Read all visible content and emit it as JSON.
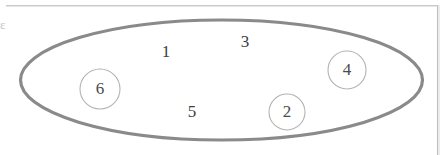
{
  "figure": {
    "kind": "ellipse-set-diagram",
    "ellipse": {
      "name": "outer-set-ellipse",
      "cx": 221.5,
      "cy": 80,
      "rx": 201,
      "ry": 60,
      "stroke": "#8a8a8a",
      "stroke_width": 3.2,
      "fill": "#ffffff"
    },
    "circle_style": {
      "stroke": "#b3b3b3",
      "stroke_width": 1.1,
      "fill": "none"
    },
    "elements": [
      {
        "id": "item-1",
        "label": "1",
        "x": 166,
        "y": 52,
        "circled": false,
        "radius": 0
      },
      {
        "id": "item-3",
        "label": "3",
        "x": 245,
        "y": 42,
        "circled": false,
        "radius": 0
      },
      {
        "id": "item-4",
        "label": "4",
        "x": 347,
        "y": 70,
        "circled": true,
        "radius": 19
      },
      {
        "id": "item-6",
        "label": "6",
        "x": 100,
        "y": 89,
        "circled": true,
        "radius": 20
      },
      {
        "id": "item-5",
        "label": "5",
        "x": 192,
        "y": 112,
        "circled": false,
        "radius": 0
      },
      {
        "id": "item-2",
        "label": "2",
        "x": 287,
        "y": 112,
        "circled": true,
        "radius": 18
      }
    ]
  },
  "page": {
    "background": "#ffffff",
    "edge_color": "#c9c9c9",
    "margin_fragment": "ε"
  }
}
